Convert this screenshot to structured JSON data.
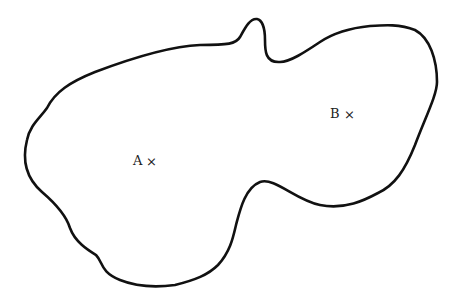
{
  "diagram": {
    "type": "closed-curve-region",
    "stroke_color": "#111111",
    "background_color": "#ffffff",
    "points": [
      {
        "label": "A",
        "marker": "×",
        "x": 152,
        "y": 161
      },
      {
        "label": "B",
        "marker": "×",
        "x": 352,
        "y": 114
      }
    ]
  }
}
